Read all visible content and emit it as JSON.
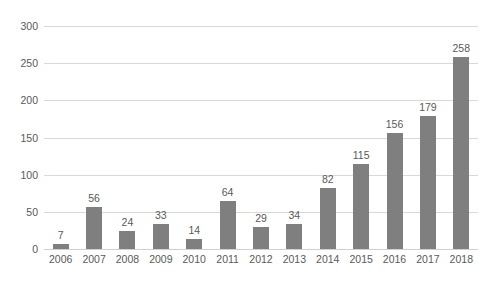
{
  "chart_data": {
    "type": "bar",
    "title": "",
    "subtitle": "",
    "xlabel": "",
    "ylabel": "",
    "categories": [
      "2006",
      "2007",
      "2008",
      "2009",
      "2010",
      "2011",
      "2012",
      "2013",
      "2014",
      "2015",
      "2016",
      "2017",
      "2018"
    ],
    "values": [
      7,
      56,
      24,
      33,
      14,
      64,
      29,
      34,
      82,
      115,
      156,
      179,
      258
    ],
    "data_labels": [
      "7",
      "56",
      "24",
      "33",
      "14",
      "64",
      "29",
      "34",
      "82",
      "115",
      "156",
      "179",
      "258"
    ],
    "ylim": [
      0,
      300
    ],
    "ytick_values": [
      300,
      250,
      200,
      150,
      100,
      50,
      0
    ],
    "ytick_labels": [
      "300",
      "250",
      "200",
      "150",
      "100",
      "50",
      "0"
    ],
    "grid": true,
    "grid_axis": "y",
    "legend": false,
    "legend_position": "none",
    "series": [
      {
        "name": "",
        "values": [
          7,
          56,
          24,
          33,
          14,
          64,
          29,
          34,
          82,
          115,
          156,
          179,
          258
        ],
        "color": "#7f7f7f"
      }
    ],
    "colors": {
      "bar": "#7f7f7f",
      "gridline": "#d9d9d9",
      "axis_text": "#595959",
      "background": "#ffffff"
    }
  }
}
